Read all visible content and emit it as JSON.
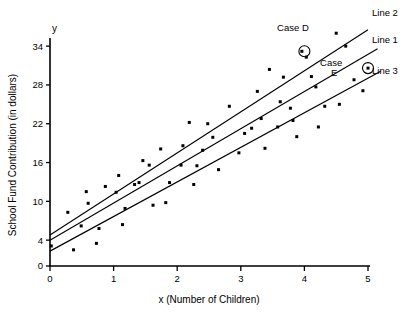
{
  "chart_data": {
    "type": "scatter",
    "title": "",
    "xlabel": "x (Number of Children)",
    "ylabel": "School Fund Contribution (in dollars)",
    "y_axis_symbol": "y",
    "xlim": [
      0,
      5
    ],
    "ylim": [
      0,
      36
    ],
    "xticks": [
      0,
      1,
      2,
      3,
      4,
      5
    ],
    "xtick_labels": [
      "0",
      "1",
      "2",
      "3",
      "4",
      "5"
    ],
    "yticks": [
      0,
      4,
      10,
      16,
      22,
      28,
      34
    ],
    "ytick_labels": [
      "0",
      "4",
      "10",
      "16",
      "22",
      "28",
      "34"
    ],
    "grid": false,
    "legend_position": "right-inline",
    "point_color": "#000000",
    "line_color": "#000000",
    "points": [
      [
        0.02,
        3.1
      ],
      [
        0.28,
        8.3
      ],
      [
        0.37,
        2.5
      ],
      [
        0.49,
        6.2
      ],
      [
        0.57,
        11.5
      ],
      [
        0.6,
        9.7
      ],
      [
        0.73,
        3.5
      ],
      [
        0.77,
        5.8
      ],
      [
        0.87,
        12.3
      ],
      [
        1.04,
        11.4
      ],
      [
        1.08,
        14.0
      ],
      [
        1.14,
        6.4
      ],
      [
        1.18,
        8.9
      ],
      [
        1.33,
        12.6
      ],
      [
        1.4,
        12.9
      ],
      [
        1.46,
        16.3
      ],
      [
        1.56,
        15.6
      ],
      [
        1.62,
        9.4
      ],
      [
        1.74,
        18.1
      ],
      [
        1.82,
        9.8
      ],
      [
        1.88,
        12.9
      ],
      [
        2.06,
        15.6
      ],
      [
        2.09,
        18.6
      ],
      [
        2.19,
        22.2
      ],
      [
        2.26,
        12.6
      ],
      [
        2.31,
        15.5
      ],
      [
        2.4,
        17.9
      ],
      [
        2.48,
        22.0
      ],
      [
        2.56,
        19.9
      ],
      [
        2.65,
        14.9
      ],
      [
        2.82,
        24.7
      ],
      [
        2.97,
        17.5
      ],
      [
        3.06,
        20.5
      ],
      [
        3.17,
        21.3
      ],
      [
        3.26,
        27.0
      ],
      [
        3.32,
        22.8
      ],
      [
        3.38,
        18.2
      ],
      [
        3.45,
        30.4
      ],
      [
        3.58,
        21.5
      ],
      [
        3.62,
        25.4
      ],
      [
        3.67,
        29.2
      ],
      [
        3.78,
        24.4
      ],
      [
        3.82,
        22.5
      ],
      [
        3.88,
        20.0
      ],
      [
        3.96,
        33.2
      ],
      [
        4.03,
        32.3
      ],
      [
        4.11,
        29.3
      ],
      [
        4.18,
        27.7
      ],
      [
        4.22,
        21.5
      ],
      [
        4.32,
        24.7
      ],
      [
        4.5,
        36.0
      ],
      [
        4.55,
        25.0
      ],
      [
        4.65,
        34.0
      ],
      [
        4.78,
        28.8
      ],
      [
        4.92,
        27.1
      ],
      [
        5.0,
        30.6
      ]
    ],
    "lines": [
      {
        "name": "Line 1",
        "label": "Line 1",
        "intercept": 4.0,
        "slope": 5.75,
        "x_start": 0.0,
        "x_end": 5.15
      },
      {
        "name": "Line 2",
        "label": "Line 2",
        "intercept": 4.8,
        "slope": 6.35,
        "x_start": 0.0,
        "x_end": 5.0
      },
      {
        "name": "Line 3",
        "label": "Line 3",
        "intercept": 2.3,
        "slope": 5.35,
        "x_start": 0.0,
        "x_end": 5.2
      }
    ],
    "annotations": [
      {
        "name": "case-d",
        "label": "Case D",
        "x": 4.0,
        "y": 33.2,
        "label_x": 3.82,
        "label_y": 36.4,
        "ring_radius": 5.5
      },
      {
        "name": "case-e",
        "label_line1": "Case",
        "label_line2": "E",
        "x": 5.0,
        "y": 30.6,
        "label_x": 4.42,
        "label_y": 30.9,
        "ring_radius": 5.5
      }
    ]
  }
}
